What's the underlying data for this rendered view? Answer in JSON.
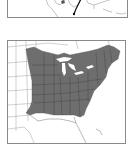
{
  "figure": {
    "top_map": {
      "label": "Partial map of southern United States with route marker",
      "marker_color": "#111111",
      "line_color": "#9a9a9a"
    },
    "main_map": {
      "label": "Range map of eastern North America",
      "range_fill": "#6e6e6e",
      "border_color": "#8a8a8a",
      "lake_color": "#ffffff",
      "region": "Eastern United States and southeastern Canada"
    }
  }
}
